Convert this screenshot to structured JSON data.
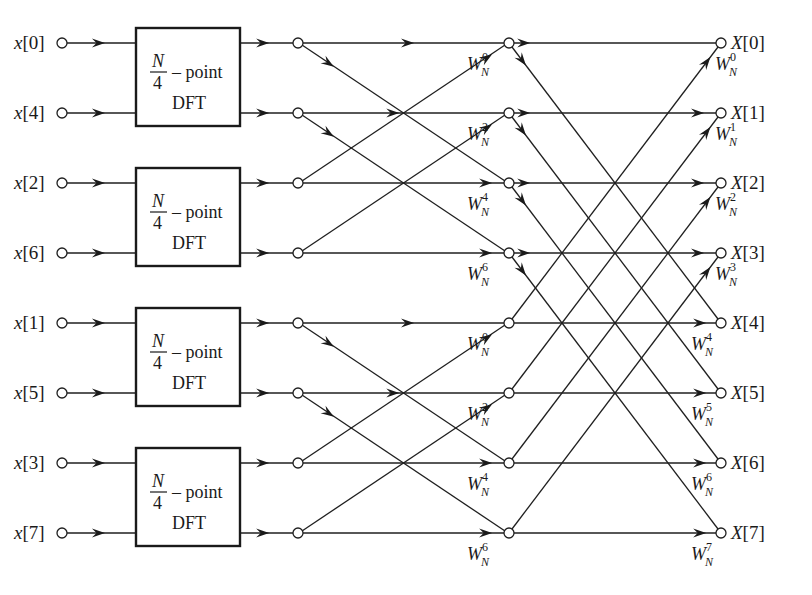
{
  "diagram": {
    "colors": {
      "ink": "#1f1f1f",
      "background": "#ffffff"
    },
    "rows_y": [
      43,
      113,
      183,
      253,
      323,
      393,
      463,
      533
    ],
    "columns_x": {
      "input_node": 62,
      "box_left": 136,
      "box_right": 240,
      "stage1_node": 298,
      "stage2_node": 509,
      "output_node": 721
    },
    "inputs": [
      {
        "label": "x[0]",
        "var": "x",
        "index": "0"
      },
      {
        "label": "x[4]",
        "var": "x",
        "index": "4"
      },
      {
        "label": "x[2]",
        "var": "x",
        "index": "2"
      },
      {
        "label": "x[6]",
        "var": "x",
        "index": "6"
      },
      {
        "label": "x[1]",
        "var": "x",
        "index": "1"
      },
      {
        "label": "x[5]",
        "var": "x",
        "index": "5"
      },
      {
        "label": "x[3]",
        "var": "x",
        "index": "3"
      },
      {
        "label": "x[7]",
        "var": "x",
        "index": "7"
      }
    ],
    "dft_blocks": [
      {
        "numerator": "N",
        "denominator": "4",
        "suffix": "– point",
        "line2": "DFT",
        "rows": [
          0,
          1
        ]
      },
      {
        "numerator": "N",
        "denominator": "4",
        "suffix": "– point",
        "line2": "DFT",
        "rows": [
          2,
          3
        ]
      },
      {
        "numerator": "N",
        "denominator": "4",
        "suffix": "– point",
        "line2": "DFT",
        "rows": [
          4,
          5
        ]
      },
      {
        "numerator": "N",
        "denominator": "4",
        "suffix": "– point",
        "line2": "DFT",
        "rows": [
          6,
          7
        ]
      }
    ],
    "outputs": [
      {
        "label": "X[0]",
        "var": "X",
        "index": "0"
      },
      {
        "label": "X[1]",
        "var": "X",
        "index": "1"
      },
      {
        "label": "X[2]",
        "var": "X",
        "index": "2"
      },
      {
        "label": "X[3]",
        "var": "X",
        "index": "3"
      },
      {
        "label": "X[4]",
        "var": "X",
        "index": "4"
      },
      {
        "label": "X[5]",
        "var": "X",
        "index": "5"
      },
      {
        "label": "X[6]",
        "var": "X",
        "index": "6"
      },
      {
        "label": "X[7]",
        "var": "X",
        "index": "7"
      }
    ],
    "stage1_twiddles": [
      {
        "base": "W",
        "sub": "N",
        "exp": "0",
        "row": 0
      },
      {
        "base": "W",
        "sub": "N",
        "exp": "2",
        "row": 1
      },
      {
        "base": "W",
        "sub": "N",
        "exp": "4",
        "row": 2
      },
      {
        "base": "W",
        "sub": "N",
        "exp": "6",
        "row": 3
      },
      {
        "base": "W",
        "sub": "N",
        "exp": "0",
        "row": 4
      },
      {
        "base": "W",
        "sub": "N",
        "exp": "2",
        "row": 5
      },
      {
        "base": "W",
        "sub": "N",
        "exp": "4",
        "row": 6
      },
      {
        "base": "W",
        "sub": "N",
        "exp": "6",
        "row": 7
      }
    ],
    "stage2_twiddles": [
      {
        "base": "W",
        "sub": "N",
        "exp": "0",
        "row": 0
      },
      {
        "base": "W",
        "sub": "N",
        "exp": "1",
        "row": 1
      },
      {
        "base": "W",
        "sub": "N",
        "exp": "2",
        "row": 2
      },
      {
        "base": "W",
        "sub": "N",
        "exp": "3",
        "row": 3
      },
      {
        "base": "W",
        "sub": "N",
        "exp": "4",
        "row": 4
      },
      {
        "base": "W",
        "sub": "N",
        "exp": "5",
        "row": 5
      },
      {
        "base": "W",
        "sub": "N",
        "exp": "6",
        "row": 6
      },
      {
        "base": "W",
        "sub": "N",
        "exp": "7",
        "row": 7
      }
    ],
    "stage1_butterflies": [
      [
        0,
        2
      ],
      [
        1,
        3
      ],
      [
        4,
        6
      ],
      [
        5,
        7
      ]
    ],
    "stage2_butterflies": [
      [
        0,
        4
      ],
      [
        1,
        5
      ],
      [
        2,
        6
      ],
      [
        3,
        7
      ]
    ]
  }
}
